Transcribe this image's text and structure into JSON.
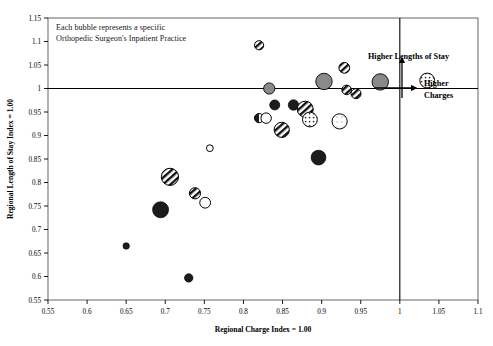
{
  "chart_data": {
    "type": "scatter",
    "title": "",
    "annotation_note": [
      "Each bubble represents a specific",
      "Orthopedic Surgeon's Inpatient Practice"
    ],
    "xlabel": "Regional Charge Index = 1.00",
    "ylabel": "Regional Length of Stay Index = 1.00",
    "xlim": [
      0.55,
      1.1
    ],
    "ylim": [
      0.55,
      1.15
    ],
    "xticks": [
      "0.55",
      "0.6",
      "0.65",
      "0.7",
      "0.75",
      "0.8",
      "0.85",
      "0.9",
      "0.95",
      "1",
      "1.05",
      "1.1"
    ],
    "yticks": [
      "0.55",
      "0.6",
      "0.65",
      "0.7",
      "0.75",
      "0.8",
      "0.85",
      "0.9",
      "0.95",
      "1",
      "1.05",
      "1.1",
      "1.15"
    ],
    "xtick_values": [
      0.55,
      0.6,
      0.65,
      0.7,
      0.75,
      0.8,
      0.85,
      0.9,
      0.95,
      1.0,
      1.05,
      1.1
    ],
    "ytick_values": [
      0.55,
      0.6,
      0.65,
      0.7,
      0.75,
      0.8,
      0.85,
      0.9,
      0.95,
      1.0,
      1.05,
      1.1,
      1.15
    ],
    "grid": false,
    "legend": "none",
    "reference_lines": [
      {
        "name": "length-of-stay-index-line",
        "axis": "horizontal",
        "value": 1.0
      },
      {
        "name": "charge-index-line",
        "axis": "vertical",
        "value": 1.0
      }
    ],
    "quadrant_arrows": [
      {
        "name": "higher-lengths-of-stay-arrow",
        "label": "Higher Lengths of Stay",
        "direction": "up"
      },
      {
        "name": "higher-charges-arrow",
        "label": "Higher",
        "label2": "Charges",
        "direction": "right"
      }
    ],
    "points": [
      {
        "x": 0.65,
        "y": 0.665,
        "r": 3.2,
        "fill": "solid"
      },
      {
        "x": 0.73,
        "y": 0.597,
        "r": 4.2,
        "fill": "solid"
      },
      {
        "x": 0.694,
        "y": 0.742,
        "r": 8.0,
        "fill": "solid"
      },
      {
        "x": 0.706,
        "y": 0.812,
        "r": 8.6,
        "fill": "striped"
      },
      {
        "x": 0.738,
        "y": 0.777,
        "r": 5.6,
        "fill": "striped"
      },
      {
        "x": 0.751,
        "y": 0.757,
        "r": 5.4,
        "fill": "open"
      },
      {
        "x": 0.757,
        "y": 0.873,
        "r": 3.4,
        "fill": "open"
      },
      {
        "x": 0.82,
        "y": 1.092,
        "r": 4.6,
        "fill": "striped"
      },
      {
        "x": 0.833,
        "y": 1.0,
        "r": 5.6,
        "fill": "gray"
      },
      {
        "x": 0.84,
        "y": 0.965,
        "r": 5.0,
        "fill": "solid"
      },
      {
        "x": 0.82,
        "y": 0.937,
        "r": 4.6,
        "fill": "half"
      },
      {
        "x": 0.829,
        "y": 0.937,
        "r": 5.2,
        "fill": "open"
      },
      {
        "x": 0.849,
        "y": 0.912,
        "r": 7.6,
        "fill": "striped"
      },
      {
        "x": 0.864,
        "y": 0.965,
        "r": 5.2,
        "fill": "solid"
      },
      {
        "x": 0.879,
        "y": 0.956,
        "r": 8.0,
        "fill": "striped"
      },
      {
        "x": 0.885,
        "y": 0.934,
        "r": 7.4,
        "fill": "dotted"
      },
      {
        "x": 0.896,
        "y": 0.853,
        "r": 7.4,
        "fill": "solid"
      },
      {
        "x": 0.903,
        "y": 1.015,
        "r": 8.2,
        "fill": "gray"
      },
      {
        "x": 0.923,
        "y": 0.93,
        "r": 7.6,
        "fill": "dotted-light"
      },
      {
        "x": 0.929,
        "y": 1.044,
        "r": 5.4,
        "fill": "striped"
      },
      {
        "x": 0.932,
        "y": 0.997,
        "r": 4.8,
        "fill": "striped"
      },
      {
        "x": 0.944,
        "y": 0.989,
        "r": 5.0,
        "fill": "striped"
      },
      {
        "x": 0.975,
        "y": 1.014,
        "r": 8.2,
        "fill": "gray"
      },
      {
        "x": 1.035,
        "y": 1.017,
        "r": 7.4,
        "fill": "dotted"
      }
    ],
    "colors": {
      "axis": "#000000",
      "solid_fill": "#1c1c1c",
      "gray_fill": "#8a8a8a",
      "open_fill": "#ffffff",
      "stroke": "#000000"
    }
  }
}
